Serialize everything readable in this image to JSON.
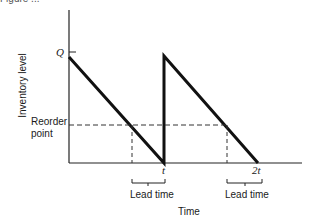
{
  "figure": {
    "caption_cropped": "Figure ...",
    "y_axis_label": "Inventory level",
    "x_axis_label": "Time",
    "q_label": "Q",
    "reorder_label_line1": "Reorder",
    "reorder_label_line2": "point",
    "t_label": "t",
    "two_t_label": "2t",
    "lead_time_1": "Lead time",
    "lead_time_2": "Lead time"
  },
  "diagram": {
    "type": "sawtooth inventory model",
    "cycles": 2,
    "max_level": "Q",
    "reorder_point": "Reorder point",
    "ticks": [
      "t",
      "2t"
    ],
    "annotations": [
      "Lead time",
      "Lead time"
    ],
    "colors": {
      "line": "#111111",
      "dashed": "#333333",
      "background": "#ffffff"
    }
  }
}
